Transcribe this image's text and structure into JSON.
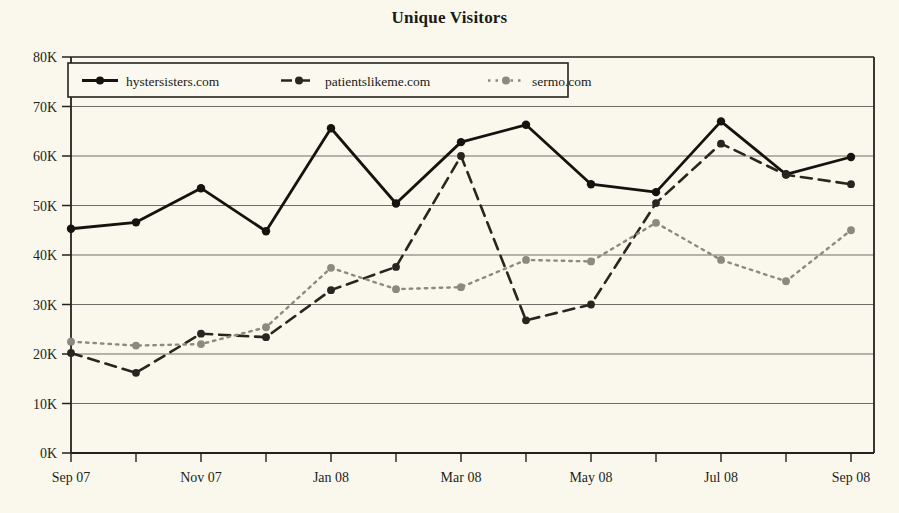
{
  "chart_data": {
    "type": "line",
    "title": "Unique Visitors",
    "xlabel": "",
    "ylabel": "",
    "ylim": [
      0,
      80000
    ],
    "ytick_labels": [
      "0K",
      "10K",
      "20K",
      "30K",
      "40K",
      "50K",
      "60K",
      "70K",
      "80K"
    ],
    "ytick_values": [
      0,
      10000,
      20000,
      30000,
      40000,
      50000,
      60000,
      70000,
      80000
    ],
    "x": [
      "Sep 07",
      "Oct 07",
      "Nov 07",
      "Dec 07",
      "Jan 08",
      "Feb 08",
      "Mar 08",
      "Apr 08",
      "May 08",
      "Jun 08",
      "Jul 08",
      "Aug 08",
      "Sep 08"
    ],
    "xtick_labels": [
      "Sep 07",
      "Nov 07",
      "Jan 08",
      "Mar 08",
      "May 08",
      "Jul 08",
      "Sep 08"
    ],
    "xtick_indices": [
      0,
      2,
      4,
      6,
      8,
      10,
      12
    ],
    "grid": true,
    "legend_position": "top-left",
    "series": [
      {
        "name": "hystersisters.com",
        "style": "solid",
        "color": "#15130f",
        "values": [
          45300,
          46600,
          53500,
          44800,
          65600,
          50400,
          62800,
          66300,
          54300,
          52700,
          67000,
          56300,
          59800
        ]
      },
      {
        "name": "patientslikeme.com",
        "style": "dashed",
        "color": "#2a2521",
        "values": [
          20200,
          16200,
          24100,
          23400,
          32900,
          37600,
          60000,
          26800,
          30000,
          50500,
          62500,
          56200,
          54300
        ]
      },
      {
        "name": "sermo.com",
        "style": "dotted",
        "color": "#8c8a80",
        "values": [
          22500,
          21700,
          22000,
          25400,
          37400,
          33100,
          33500,
          39000,
          38700,
          46500,
          39000,
          34700,
          45000
        ]
      }
    ]
  },
  "legend": {
    "items": [
      {
        "label": "hystersisters.com"
      },
      {
        "label": "patientslikeme.com"
      },
      {
        "label": "sermo.com"
      }
    ]
  }
}
